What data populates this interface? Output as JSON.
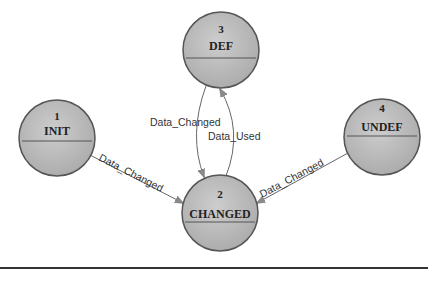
{
  "diagram": {
    "type": "state-transition",
    "colors": {
      "node_fill": "#bdbdbd",
      "node_stroke": "#555555",
      "edge": "#666666",
      "arrow": "#8a8a8a",
      "rule": "#333333"
    },
    "nodes": [
      {
        "id": "def",
        "number": "3",
        "label": "DEF"
      },
      {
        "id": "init",
        "number": "1",
        "label": "INIT"
      },
      {
        "id": "undef",
        "number": "4",
        "label": "UNDEF"
      },
      {
        "id": "changed",
        "number": "2",
        "label": "CHANGED"
      }
    ],
    "edges": [
      {
        "from": "init",
        "to": "changed",
        "label": "Data_Changed"
      },
      {
        "from": "def",
        "to": "changed",
        "label": "Data_Changed"
      },
      {
        "from": "changed",
        "to": "def",
        "label": "Data_Used"
      },
      {
        "from": "undef",
        "to": "changed",
        "label": "Data_Changed"
      }
    ]
  }
}
